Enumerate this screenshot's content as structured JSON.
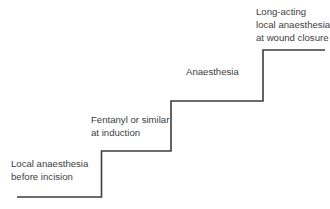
{
  "diagram": {
    "type": "staircase",
    "line_color": "#3c3c3c",
    "steps": [
      {
        "label": "Local anaesthesia\nbefore incision"
      },
      {
        "label": "Fentanyl or similar\nat induction"
      },
      {
        "label": "Anaesthesia"
      },
      {
        "label": "Long-acting\nlocal anaesthesia\nat wound closure"
      }
    ]
  }
}
